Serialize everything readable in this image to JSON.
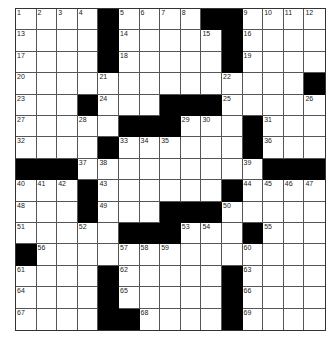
{
  "puzzle": {
    "rows": 15,
    "cols": 15,
    "colors": {
      "block": "#000000",
      "cell": "#ffffff",
      "line": "#555555"
    },
    "layout": [
      "1234#5678##9ABC",
      "....#.........",
      "....#.....#....",
      "..............#",
      "...#...###.....",
      ".......##...#...",
      "....#......#...",
      "###..........###",
      "...#......#....",
      "...#...###.....",
      ".....###...#...",
      "#..............",
      "....#.....#....",
      "....#.....#....",
      "....##....#...."
    ],
    "grid": [
      [
        1,
        2,
        3,
        4,
        "#",
        5,
        6,
        7,
        8,
        "#",
        "#",
        9,
        10,
        11,
        12
      ],
      [
        13,
        0,
        0,
        0,
        "#",
        14,
        0,
        0,
        0,
        15,
        "#",
        16,
        0,
        0,
        0
      ],
      [
        17,
        0,
        0,
        0,
        "#",
        18,
        0,
        0,
        0,
        0,
        "#",
        19,
        0,
        0,
        0
      ],
      [
        20,
        0,
        0,
        0,
        21,
        0,
        0,
        0,
        0,
        0,
        22,
        0,
        0,
        0,
        "#"
      ],
      [
        23,
        0,
        0,
        "#",
        24,
        0,
        0,
        "#",
        "#",
        "#",
        25,
        0,
        0,
        0,
        26
      ],
      [
        27,
        0,
        0,
        28,
        0,
        "#",
        "#",
        "#",
        29,
        30,
        0,
        "#",
        31,
        0,
        0
      ],
      [
        32,
        0,
        0,
        0,
        "#",
        33,
        34,
        35,
        0,
        0,
        0,
        "#",
        36,
        0,
        0
      ],
      [
        "#",
        "#",
        "#",
        37,
        38,
        0,
        0,
        0,
        0,
        0,
        0,
        39,
        "#",
        "#",
        "#"
      ],
      [
        40,
        41,
        42,
        "#",
        43,
        0,
        0,
        0,
        0,
        0,
        "#",
        44,
        45,
        46,
        47
      ],
      [
        48,
        0,
        0,
        "#",
        49,
        0,
        0,
        "#",
        "#",
        "#",
        50,
        0,
        0,
        0,
        0
      ],
      [
        51,
        0,
        0,
        52,
        0,
        "#",
        "#",
        "#",
        53,
        54,
        0,
        "#",
        55,
        0,
        0
      ],
      [
        "#",
        56,
        0,
        0,
        0,
        57,
        58,
        59,
        0,
        0,
        0,
        60,
        0,
        0,
        0
      ],
      [
        61,
        0,
        0,
        0,
        "#",
        62,
        0,
        0,
        0,
        0,
        "#",
        63,
        0,
        0,
        0
      ],
      [
        64,
        0,
        0,
        0,
        "#",
        65,
        0,
        0,
        0,
        0,
        "#",
        66,
        0,
        0,
        0
      ],
      [
        67,
        0,
        0,
        0,
        "#",
        "#",
        68,
        0,
        0,
        0,
        "#",
        69,
        0,
        0,
        0
      ]
    ]
  }
}
